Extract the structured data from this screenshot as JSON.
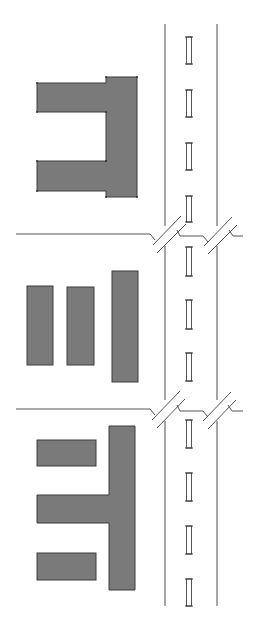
{
  "diagram": {
    "type": "site-plan",
    "colors": {
      "building_fill": "#7a7a7a",
      "building_stroke": "#3c3c3c",
      "road_line": "#6a6a6a",
      "background": "#ffffff"
    },
    "road": {
      "left_edge_x": 165,
      "right_edge_x": 217,
      "top_y": 24,
      "bottom_y": 606,
      "center_x": 189,
      "dashes": [
        [
          37,
          64
        ],
        [
          90,
          117
        ],
        [
          143,
          170
        ],
        [
          196,
          222
        ],
        [
          247,
          276
        ],
        [
          300,
          329
        ],
        [
          353,
          381
        ],
        [
          420,
          448
        ],
        [
          473,
          501
        ],
        [
          526,
          554
        ],
        [
          579,
          606
        ]
      ]
    },
    "junctions": [
      {
        "street_y": 234,
        "street_start_x": 16
      },
      {
        "street_y": 409,
        "street_start_x": 16
      }
    ],
    "building_groups": [
      {
        "name": "U-shaped block",
        "parts": 3
      },
      {
        "name": "three parallel bars",
        "parts": 3
      },
      {
        "name": "T-shaped block with two wings",
        "parts": 4
      }
    ]
  }
}
